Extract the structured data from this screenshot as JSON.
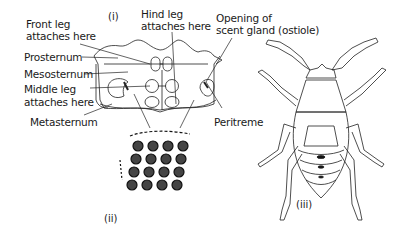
{
  "figure": {
    "panels": [
      {
        "id": "i",
        "label": "(i)",
        "description": "Underside of thorax"
      },
      {
        "id": "ii",
        "label": "(ii)",
        "description": "Surface texture of peritreme"
      },
      {
        "id": "iii",
        "label": "(iii)",
        "description": "Whole insect, dorsal view"
      }
    ],
    "labels": {
      "front_leg_line1": "Front leg",
      "front_leg_line2": "attaches here",
      "hind_leg_line1": "Hind leg",
      "hind_leg_line2": "attaches here",
      "prosternum": "Prosternum",
      "mesosternum": "Mesosternum",
      "middle_leg_line1": "Middle leg",
      "middle_leg_line2": "attaches here",
      "metasternum": "Metasternum",
      "ostiole_line1": "Opening of",
      "ostiole_line2": "scent gland (ostiole)",
      "peritreme": "Peritreme"
    }
  }
}
